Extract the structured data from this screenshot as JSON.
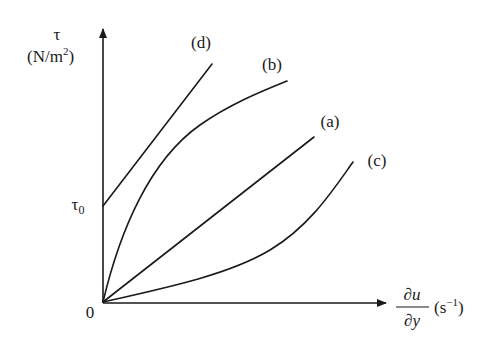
{
  "diagram": {
    "y_axis": {
      "symbol": "τ",
      "unit_open": "(N/m",
      "unit_sup": "2",
      "unit_close": ")"
    },
    "x_axis": {
      "numerator": "∂u",
      "denominator": "∂y",
      "unit_open": "(s",
      "unit_sup": "−1",
      "unit_close": ")"
    },
    "origin_label": "0",
    "tau0": {
      "symbol": "τ",
      "subscript": "0"
    },
    "curves": [
      {
        "id": "a",
        "label": "(a)",
        "shape": "straight line through origin"
      },
      {
        "id": "b",
        "label": "(b)",
        "shape": "concave down through origin"
      },
      {
        "id": "c",
        "label": "(c)",
        "shape": "concave up through origin"
      },
      {
        "id": "d",
        "label": "(d)",
        "shape": "straight line with intercept τ0"
      }
    ],
    "colors": {
      "ink": "#1a1a1a",
      "background": "#ffffff"
    }
  }
}
